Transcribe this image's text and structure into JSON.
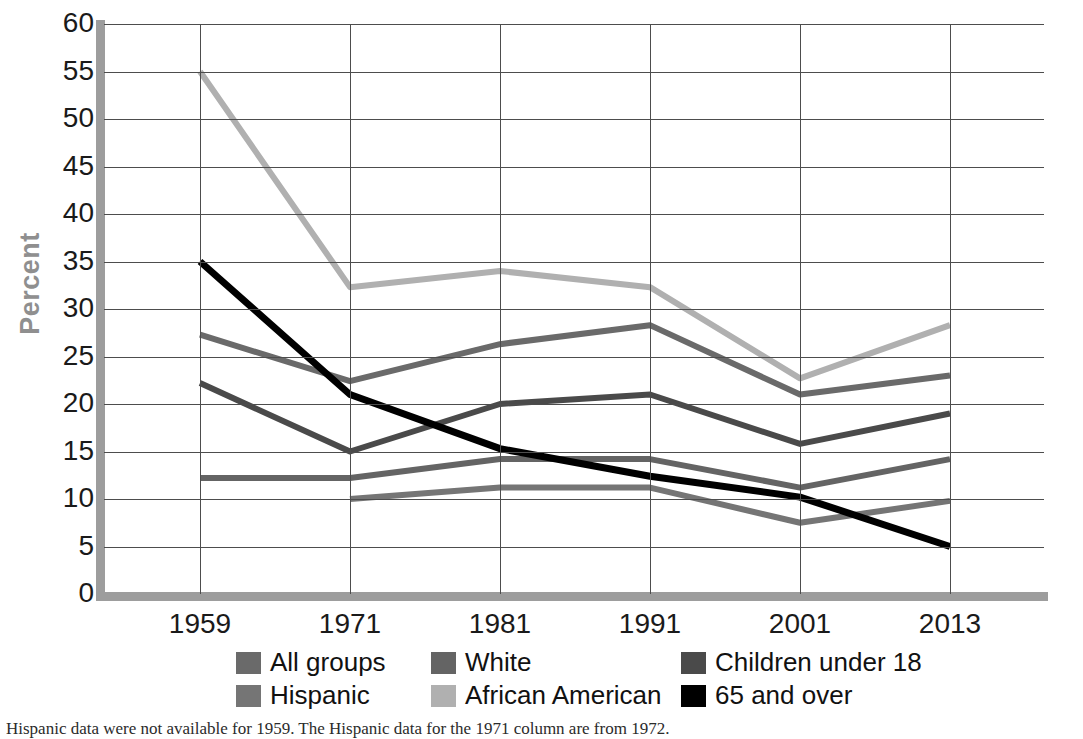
{
  "chart_data": {
    "type": "line",
    "title": "",
    "xlabel": "",
    "ylabel": "Percent",
    "categories": [
      "1959",
      "1971",
      "1981",
      "1991",
      "2001",
      "2013"
    ],
    "ylim": [
      0,
      60
    ],
    "yticks": [
      0,
      5,
      10,
      15,
      20,
      25,
      30,
      35,
      40,
      45,
      50,
      55,
      60
    ],
    "grid": true,
    "legend_position": "bottom",
    "series": [
      {
        "name": "All groups",
        "color": "#6a6a6a",
        "values": [
          27.3,
          22.4,
          26.3,
          28.3,
          21.0,
          23.0
        ]
      },
      {
        "name": "White",
        "color": "#646464",
        "values": [
          12.2,
          12.2,
          14.2,
          14.2,
          11.2,
          14.2
        ]
      },
      {
        "name": "Children under 18",
        "color": "#4a4a4a",
        "values": [
          22.2,
          15.0,
          20.0,
          21.0,
          15.8,
          19.0
        ]
      },
      {
        "name": "Hispanic",
        "color": "#757575",
        "values": [
          null,
          10.0,
          11.2,
          11.2,
          7.5,
          9.8
        ]
      },
      {
        "name": "African American",
        "color": "#b0b0b0",
        "values": [
          55.0,
          32.3,
          34.0,
          32.3,
          22.7,
          28.3
        ]
      },
      {
        "name": "65 and over",
        "color": "#000000",
        "values": [
          35.0,
          21.0,
          15.3,
          12.4,
          10.2,
          5.0
        ]
      }
    ]
  },
  "axis": {
    "y_title": "Percent",
    "y_tick_labels": [
      "60",
      "55",
      "50",
      "45",
      "40",
      "35",
      "30",
      "25",
      "20",
      "15",
      "10",
      "5",
      "0"
    ],
    "x_tick_labels": [
      "1959",
      "1971",
      "1981",
      "1991",
      "2001",
      "2013"
    ]
  },
  "legend": {
    "rows": [
      [
        {
          "label": "All groups",
          "color": "#6a6a6a"
        },
        {
          "label": "White",
          "color": "#646464"
        },
        {
          "label": "Children under 18",
          "color": "#4a4a4a"
        }
      ],
      [
        {
          "label": "Hispanic",
          "color": "#757575"
        },
        {
          "label": "African American",
          "color": "#b0b0b0"
        },
        {
          "label": "65 and over",
          "color": "#000000"
        }
      ]
    ]
  },
  "footnote": {
    "text": "Hispanic data were not available for 1959. The Hispanic data for the 1971 column are from 1972."
  }
}
